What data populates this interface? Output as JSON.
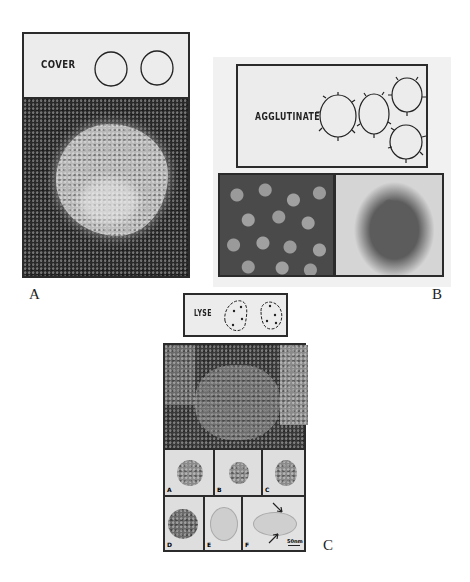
{
  "figure": {
    "panels": [
      {
        "id": "A",
        "label": "A",
        "schematic_text": "COVER",
        "schematic_description": "two plain circles",
        "micrograph": "single virus particle covered with antibody, negative stain, dark background"
      },
      {
        "id": "B",
        "label": "B",
        "schematic_text": "AGGLUTINATE",
        "schematic_description": "four circles with spikes clumped together",
        "micrographs": [
          "dispersed virus particles",
          "agglutinated virus particles"
        ]
      },
      {
        "id": "C",
        "label": "C",
        "schematic_text": "LYSE",
        "schematic_description": "two oval outlines with dots inside and spikes",
        "micrograph": "lysed particle, dark background",
        "subpanels": [
          {
            "label": "A"
          },
          {
            "label": "B"
          },
          {
            "label": "C"
          },
          {
            "label": "D"
          },
          {
            "label": "E"
          },
          {
            "label": "F"
          }
        ],
        "scale_bar": "50nm"
      }
    ]
  },
  "colors": {
    "page_bg": "#ffffff",
    "schematic_bg": "#ececec",
    "frame": "#2b2b2b",
    "micro_dark": "#2a2a2a",
    "micro_light": "#d9d9d9"
  }
}
